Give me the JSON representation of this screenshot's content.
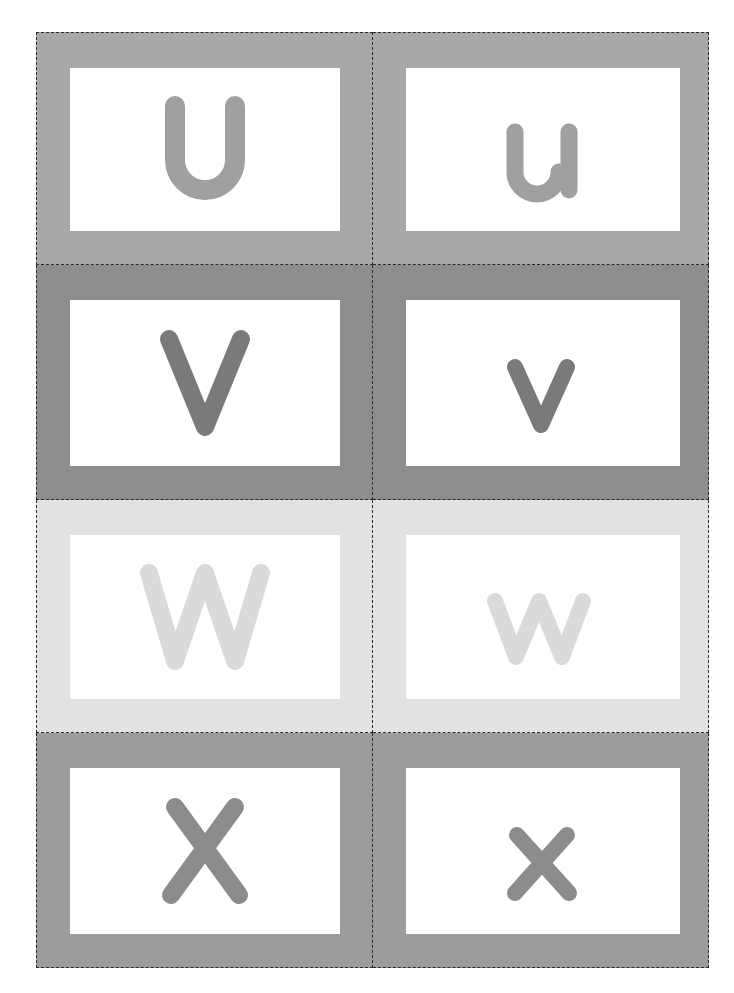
{
  "sheet": {
    "title": "Letter flashcards U–X",
    "cards": [
      {
        "letter": "U",
        "case": "upper",
        "frame_color": "#a8a8a8",
        "letter_color": "#a0a0a0"
      },
      {
        "letter": "u",
        "case": "lower",
        "frame_color": "#a8a8a8",
        "letter_color": "#a0a0a0"
      },
      {
        "letter": "V",
        "case": "upper",
        "frame_color": "#8e8e8e",
        "letter_color": "#7a7a7a"
      },
      {
        "letter": "v",
        "case": "lower",
        "frame_color": "#8e8e8e",
        "letter_color": "#7a7a7a"
      },
      {
        "letter": "W",
        "case": "upper",
        "frame_color": "#e2e2e2",
        "letter_color": "#dadada"
      },
      {
        "letter": "w",
        "case": "lower",
        "frame_color": "#e2e2e2",
        "letter_color": "#dadada"
      },
      {
        "letter": "X",
        "case": "upper",
        "frame_color": "#9c9c9c",
        "letter_color": "#8c8c8c"
      },
      {
        "letter": "x",
        "case": "lower",
        "frame_color": "#9c9c9c",
        "letter_color": "#8c8c8c"
      }
    ],
    "cut_line_style": "dashed",
    "cut_line_color": "#2a2a2a"
  }
}
